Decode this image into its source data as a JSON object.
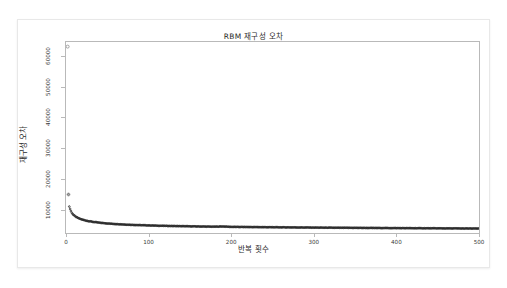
{
  "chart_data": {
    "type": "scatter",
    "title": "RBM 재구성 오차",
    "xlabel": "반복 횟수",
    "ylabel": "재구성 오차",
    "xlim": [
      0,
      500
    ],
    "ylim": [
      2500,
      64500
    ],
    "xticks": [
      0,
      100,
      200,
      300,
      400,
      500
    ],
    "yticks": [
      10000,
      20000,
      30000,
      40000,
      50000,
      60000
    ],
    "xtick_labels": [
      "0",
      "100",
      "200",
      "300",
      "400",
      "500"
    ],
    "ytick_labels": [
      "10000",
      "20000",
      "30000",
      "40000",
      "50000",
      "60000"
    ],
    "grid": false,
    "legend": null,
    "marker": "open-circle",
    "series_color": "#222222",
    "series": [
      {
        "name": "재구성 오차",
        "x": [
          2,
          3,
          4,
          5,
          6,
          7,
          8,
          9,
          10,
          12,
          14,
          16,
          18,
          20,
          24,
          28,
          32,
          36,
          40,
          45,
          50,
          55,
          60,
          65,
          70,
          75,
          80,
          85,
          90,
          95,
          100,
          110,
          120,
          130,
          140,
          150,
          160,
          170,
          180,
          190,
          200,
          210,
          220,
          230,
          240,
          250,
          260,
          270,
          280,
          290,
          300,
          310,
          320,
          330,
          340,
          350,
          360,
          370,
          380,
          390,
          400,
          410,
          420,
          430,
          440,
          450,
          460,
          470,
          480,
          490,
          500
        ],
        "y": [
          63000,
          15000,
          11100,
          10300,
          9600,
          9100,
          8700,
          8400,
          8150,
          7750,
          7450,
          7200,
          7000,
          6820,
          6540,
          6320,
          6140,
          5990,
          5860,
          5720,
          5600,
          5500,
          5410,
          5330,
          5260,
          5200,
          5140,
          5090,
          5040,
          5000,
          4960,
          4880,
          4820,
          4760,
          4710,
          4660,
          4620,
          4580,
          4550,
          4620,
          4490,
          4460,
          4440,
          4410,
          4390,
          4360,
          4340,
          4320,
          4300,
          4280,
          4260,
          4240,
          4220,
          4200,
          4190,
          4170,
          4150,
          4130,
          4120,
          4100,
          4080,
          4070,
          4050,
          4040,
          4020,
          4010,
          3990,
          3980,
          3960,
          3950,
          3940
        ]
      }
    ],
    "annotations": [
      {
        "label": "outlier-initial",
        "x": 2,
        "y": 63000
      },
      {
        "label": "outlier-second",
        "x": 3,
        "y": 15000
      }
    ]
  }
}
